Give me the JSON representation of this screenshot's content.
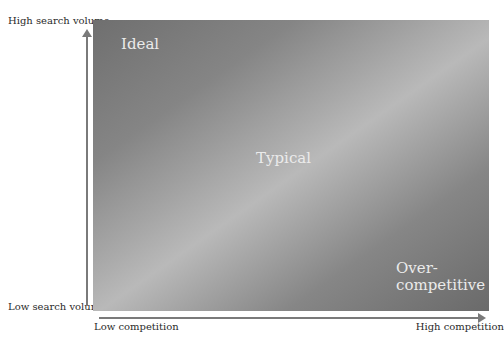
{
  "diagram": {
    "type": "quadrant-gradient",
    "y_axis": {
      "high_label": "High search volume",
      "low_label": "Low search volume"
    },
    "x_axis": {
      "low_label": "Low competition",
      "high_label": "High competition"
    },
    "regions": {
      "ideal": "Ideal",
      "typical": "Typical",
      "over_competitive_line1": "Over-",
      "over_competitive_line2": "competitive"
    },
    "colors": {
      "dark": "#6f6f6f",
      "light": "#b9b9b9",
      "axis": "#7a7a7a",
      "region_text": "#ebebeb"
    }
  }
}
